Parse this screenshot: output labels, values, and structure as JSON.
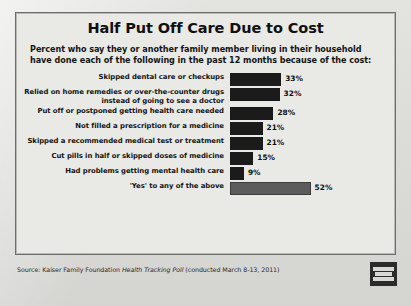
{
  "title": "Half Put Off Care Due to Cost",
  "subtitle": "Percent who say they or another family member living in their household have done each of the following in the past 12 months because of the cost:",
  "source": {
    "prefix": "Source: Kaiser Family Foundation ",
    "italic": "Health Tracking Poll",
    "suffix": " (conducted March 8-13, 2011)"
  },
  "logo": {
    "name": "kaiser-family-foundation-logo",
    "line1": "KAISER",
    "line2": "FAMILY",
    "line3": "FOUNDATION"
  },
  "colors": {
    "bar": "#1b1b1b",
    "bar_highlight": "#5c5c5c",
    "frame": "#6d6d6d",
    "panel": "#e9e9e6"
  },
  "chart_data": {
    "type": "bar",
    "title": "Half Put Off Care Due to Cost",
    "subtitle": "Percent who say they or another family member living in their household have done each of the following in the past 12 months because of the cost:",
    "orientation": "horizontal",
    "xlabel": "",
    "ylabel": "",
    "xlim": [
      0,
      55
    ],
    "grid": false,
    "legend": false,
    "value_suffix": "%",
    "categories": [
      "Skipped dental care or checkups",
      "Relied on home remedies or over-the-counter drugs instead of going to see a doctor",
      "Put off or postponed getting health care needed",
      "Not filled a prescription for a medicine",
      "Skipped a recommended medical test or treatment",
      "Cut pills in half or skipped doses of medicine",
      "Had problems getting mental health care",
      "'Yes' to any of the above"
    ],
    "values": [
      33,
      32,
      28,
      21,
      21,
      15,
      9,
      52
    ],
    "labels": [
      "33%",
      "32%",
      "28%",
      "21%",
      "21%",
      "15%",
      "9%",
      "52%"
    ],
    "highlight_index": 7
  }
}
